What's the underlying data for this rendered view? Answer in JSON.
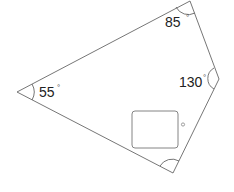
{
  "diagram": {
    "type": "quadrilateral-angles",
    "shape": "quadrilateral",
    "angles": [
      {
        "vertex": "top",
        "value": "85",
        "unit": "°"
      },
      {
        "vertex": "right",
        "value": "130",
        "unit": "°"
      },
      {
        "vertex": "left",
        "value": "55",
        "unit": "°"
      },
      {
        "vertex": "bottom",
        "value": "",
        "unit": "°",
        "unknown": true
      }
    ],
    "answer_box": {
      "value": "",
      "unit": "°"
    },
    "colors": {
      "stroke": "#555555",
      "text": "#222222",
      "background": "#ffffff"
    }
  }
}
